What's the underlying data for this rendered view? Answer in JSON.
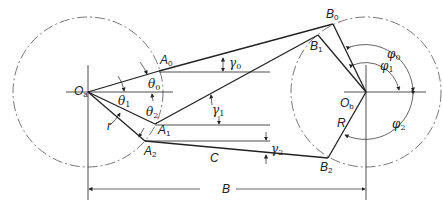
{
  "diagram": {
    "labels": {
      "Oa": {
        "base": "O",
        "sub": "a"
      },
      "Ob": {
        "base": "O",
        "sub": "b"
      },
      "A0": {
        "base": "A",
        "sub": "0"
      },
      "A1": {
        "base": "A",
        "sub": "1"
      },
      "A2": {
        "base": "A",
        "sub": "2"
      },
      "B0": {
        "base": "B",
        "sub": "0"
      },
      "B1": {
        "base": "B",
        "sub": "1"
      },
      "B2": {
        "base": "B",
        "sub": "2"
      },
      "theta0": {
        "base": "θ",
        "sub": "0"
      },
      "theta1": {
        "base": "θ",
        "sub": "1"
      },
      "theta2": {
        "base": "θ",
        "sub": "2"
      },
      "phi0": {
        "base": "φ",
        "sub": "0"
      },
      "phi1": {
        "base": "φ",
        "sub": "1"
      },
      "phi2": {
        "base": "φ",
        "sub": "2"
      },
      "gamma0": {
        "base": "γ",
        "sub": "0"
      },
      "gamma1": {
        "base": "γ",
        "sub": "1"
      },
      "gamma2": {
        "base": "γ",
        "sub": "2"
      },
      "r": "r",
      "R": "R",
      "C": "C",
      "B": "B"
    },
    "colors": {
      "line": "#222222",
      "dashed_circle": "#555555",
      "background": "#ffffff"
    }
  }
}
